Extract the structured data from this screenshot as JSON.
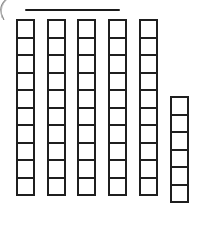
{
  "figure": {
    "background_color": "#ffffff",
    "ink_color": "#1f1f1f",
    "width": 203,
    "height": 228
  },
  "top_rule": {
    "label": "horizontal rule",
    "x": 25,
    "y": 9,
    "width": 95,
    "height": 2,
    "color": "#1b1b1b"
  },
  "corner_mark": {
    "label": "faint curved scan artifact",
    "color": "#8d8d8d"
  },
  "chart_data": {
    "type": "bar",
    "subtitle": "",
    "xlabel": "",
    "ylabel": "",
    "unit": "unit square",
    "orientation": "vertical",
    "grid": false,
    "legend": false,
    "categories": [
      "1",
      "2",
      "3",
      "4",
      "5",
      "6"
    ],
    "values": [
      10,
      10,
      10,
      10,
      10,
      6
    ],
    "ylim": [
      0,
      10
    ],
    "total": 56
  },
  "columns": [
    {
      "name": "rod-1",
      "cells": 10,
      "x": 16,
      "top": 19,
      "cell_w": 19,
      "cell_h": 19.5
    },
    {
      "name": "rod-2",
      "cells": 10,
      "x": 47,
      "top": 19,
      "cell_w": 19,
      "cell_h": 19.5
    },
    {
      "name": "rod-3",
      "cells": 10,
      "x": 77,
      "top": 19,
      "cell_w": 19,
      "cell_h": 19.5
    },
    {
      "name": "rod-4",
      "cells": 10,
      "x": 108,
      "top": 19,
      "cell_w": 19,
      "cell_h": 19.5
    },
    {
      "name": "rod-5",
      "cells": 10,
      "x": 139,
      "top": 19,
      "cell_w": 19,
      "cell_h": 19.5
    },
    {
      "name": "rod-6",
      "cells": 6,
      "x": 170,
      "top": 96,
      "cell_w": 19,
      "cell_h": 19.5
    }
  ]
}
